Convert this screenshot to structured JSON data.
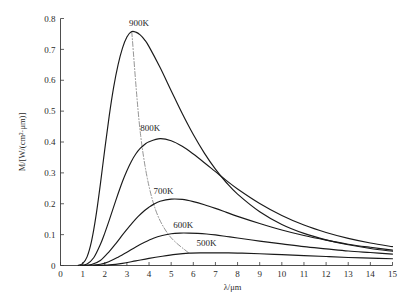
{
  "chart_data": {
    "type": "line",
    "title": "",
    "subtitle": "",
    "xlabel": "λ/μm",
    "ylabel": "M/[W/(cm²·μm)]",
    "xlim": [
      0,
      15
    ],
    "ylim": [
      0,
      0.8
    ],
    "grid": false,
    "legend_position": "inline-annotations",
    "xticks": [
      "0",
      "1",
      "2",
      "3",
      "4",
      "5",
      "6",
      "7",
      "8",
      "9",
      "10",
      "11",
      "12",
      "13",
      "14",
      "15"
    ],
    "xtick_values": [
      0,
      1,
      2,
      3,
      4,
      5,
      6,
      7,
      8,
      9,
      10,
      11,
      12,
      13,
      14,
      15
    ],
    "yticks": [
      "0",
      "0.1",
      "0.2",
      "0.3",
      "0.4",
      "0.5",
      "0.6",
      "0.7",
      "0.8"
    ],
    "ytick_values": [
      0,
      0.1,
      0.2,
      0.3,
      0.4,
      0.5,
      0.6,
      0.7,
      0.8
    ],
    "annotations": [
      {
        "text": "900K",
        "x": 3.55,
        "y": 0.775
      },
      {
        "text": "800K",
        "x": 4.05,
        "y": 0.435
      },
      {
        "text": "700K",
        "x": 4.65,
        "y": 0.231
      },
      {
        "text": "600K",
        "x": 5.55,
        "y": 0.122
      },
      {
        "text": "500K",
        "x": 6.6,
        "y": 0.062
      }
    ],
    "series": [
      {
        "name": "900K",
        "temperature_K": 900,
        "peak_lambda_um": 3.22,
        "peak_value": 0.757,
        "x": [
          0.8,
          1.0,
          1.2,
          1.4,
          1.6,
          1.8,
          2.0,
          2.2,
          2.4,
          2.6,
          2.8,
          3.0,
          3.2,
          3.4,
          3.6,
          3.8,
          4.0,
          4.5,
          5.0,
          5.5,
          6.0,
          6.5,
          7.0,
          7.5,
          8.0,
          9.0,
          10.0,
          11.0,
          12.0,
          13.0,
          14.0,
          15.0
        ],
        "y": [
          0.0005,
          0.006,
          0.028,
          0.078,
          0.159,
          0.263,
          0.376,
          0.484,
          0.577,
          0.65,
          0.704,
          0.74,
          0.757,
          0.756,
          0.747,
          0.731,
          0.709,
          0.641,
          0.566,
          0.492,
          0.424,
          0.364,
          0.312,
          0.268,
          0.231,
          0.174,
          0.133,
          0.104,
          0.083,
          0.067,
          0.055,
          0.046
        ]
      },
      {
        "name": "800K",
        "temperature_K": 800,
        "peak_lambda_um": 3.62,
        "peak_value": 0.422,
        "x": [
          0.9,
          1.2,
          1.5,
          1.8,
          2.0,
          2.2,
          2.5,
          2.8,
          3.0,
          3.2,
          3.4,
          3.6,
          3.8,
          4.0,
          4.5,
          5.0,
          5.5,
          6.0,
          6.5,
          7.0,
          7.5,
          8.0,
          9.0,
          10.0,
          11.0,
          12.0,
          13.0,
          14.0,
          15.0
        ],
        "y": [
          0.0002,
          0.005,
          0.025,
          0.068,
          0.105,
          0.146,
          0.211,
          0.272,
          0.307,
          0.337,
          0.361,
          0.379,
          0.392,
          0.401,
          0.411,
          0.404,
          0.386,
          0.361,
          0.333,
          0.304,
          0.275,
          0.248,
          0.201,
          0.162,
          0.131,
          0.107,
          0.088,
          0.073,
          0.061
        ]
      },
      {
        "name": "700K",
        "temperature_K": 700,
        "peak_lambda_um": 4.14,
        "peak_value": 0.216,
        "x": [
          1.0,
          1.4,
          1.8,
          2.2,
          2.5,
          2.8,
          3.0,
          3.2,
          3.5,
          3.8,
          4.0,
          4.2,
          4.5,
          5.0,
          5.5,
          6.0,
          6.5,
          7.0,
          7.5,
          8.0,
          9.0,
          10.0,
          11.0,
          12.0,
          13.0,
          14.0,
          15.0
        ],
        "y": [
          0.0001,
          0.003,
          0.016,
          0.045,
          0.071,
          0.099,
          0.117,
          0.134,
          0.158,
          0.178,
          0.189,
          0.198,
          0.208,
          0.215,
          0.214,
          0.207,
          0.197,
          0.185,
          0.172,
          0.159,
          0.136,
          0.115,
          0.097,
          0.082,
          0.069,
          0.059,
          0.05
        ]
      },
      {
        "name": "600K",
        "temperature_K": 600,
        "peak_lambda_um": 4.83,
        "peak_value": 0.105,
        "x": [
          1.2,
          1.8,
          2.2,
          2.6,
          3.0,
          3.4,
          3.8,
          4.2,
          4.6,
          5.0,
          5.4,
          5.8,
          6.2,
          6.6,
          7.0,
          7.5,
          8.0,
          9.0,
          10.0,
          11.0,
          12.0,
          13.0,
          14.0,
          15.0
        ],
        "y": [
          5e-05,
          0.004,
          0.013,
          0.027,
          0.043,
          0.06,
          0.075,
          0.088,
          0.097,
          0.103,
          0.105,
          0.105,
          0.104,
          0.102,
          0.099,
          0.094,
          0.089,
          0.079,
          0.07,
          0.061,
          0.054,
          0.047,
          0.042,
          0.037
        ]
      },
      {
        "name": "500K",
        "temperature_K": 500,
        "peak_lambda_um": 5.8,
        "peak_value": 0.04,
        "x": [
          1.5,
          2.2,
          2.8,
          3.4,
          4.0,
          4.6,
          5.2,
          5.8,
          6.4,
          7.0,
          7.6,
          8.2,
          9.0,
          10.0,
          11.0,
          12.0,
          13.0,
          14.0,
          15.0
        ],
        "y": [
          2e-05,
          0.002,
          0.007,
          0.015,
          0.023,
          0.03,
          0.036,
          0.04,
          0.041,
          0.041,
          0.041,
          0.04,
          0.038,
          0.035,
          0.032,
          0.029,
          0.026,
          0.024,
          0.022
        ]
      }
    ],
    "wien_locus": {
      "name": "Wien displacement locus",
      "style": "dash-dot",
      "x": [
        3.22,
        3.62,
        4.14,
        4.83,
        5.8
      ],
      "y": [
        0.757,
        0.422,
        0.216,
        0.105,
        0.04
      ]
    }
  }
}
